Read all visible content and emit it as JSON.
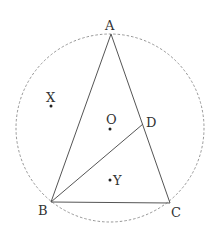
{
  "diagram": {
    "type": "geometry",
    "colors": {
      "stroke": "#555555",
      "circle": "#888888",
      "text": "#333333"
    },
    "circle": {
      "center": "O",
      "style": "dashed"
    },
    "points": {
      "A": {
        "label": "A"
      },
      "B": {
        "label": "B"
      },
      "C": {
        "label": "C"
      },
      "D": {
        "label": "D"
      },
      "O": {
        "label": "O"
      },
      "X": {
        "label": "X"
      },
      "Y": {
        "label": "Y"
      }
    },
    "segments": [
      "AB",
      "AC",
      "BC",
      "BD"
    ]
  }
}
